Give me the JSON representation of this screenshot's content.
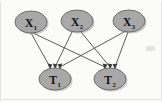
{
  "figure": {
    "type": "directed-bipartite-graph",
    "background_color": "#fbfbfa",
    "node_fill_color": "#a8a8a8",
    "node_stroke_color": "#6e6e6e",
    "edge_color": "#4a4a4a",
    "label_color": "#111111"
  },
  "nodes": {
    "top": [
      {
        "id": "X1",
        "main": "X",
        "sub": "1",
        "cx": 31,
        "cy": 22,
        "rx": 16,
        "ry": 11
      },
      {
        "id": "X2",
        "main": "X",
        "sub": "2",
        "cx": 77,
        "cy": 21,
        "rx": 16,
        "ry": 11
      },
      {
        "id": "X3",
        "main": "X",
        "sub": "3",
        "cx": 129,
        "cy": 21,
        "rx": 16,
        "ry": 11
      }
    ],
    "bottom": [
      {
        "id": "T1",
        "main": "T",
        "sub": "1",
        "cx": 55,
        "cy": 79,
        "rx": 16,
        "ry": 11
      },
      {
        "id": "T2",
        "main": "T",
        "sub": "2",
        "cx": 110,
        "cy": 79,
        "rx": 16,
        "ry": 11
      }
    ]
  },
  "edges": [
    {
      "from": "X1",
      "to": "T1"
    },
    {
      "from": "X1",
      "to": "T2"
    },
    {
      "from": "X2",
      "to": "T1"
    },
    {
      "from": "X2",
      "to": "T2"
    },
    {
      "from": "X3",
      "to": "T1"
    },
    {
      "from": "X3",
      "to": "T2"
    }
  ],
  "labels": {
    "x1": "X",
    "x1_sub": "1",
    "x2": "X",
    "x2_sub": "2",
    "x3": "X",
    "x3_sub": "3",
    "t1": "T",
    "t1_sub": "1",
    "t2": "T",
    "t2_sub": "2"
  }
}
